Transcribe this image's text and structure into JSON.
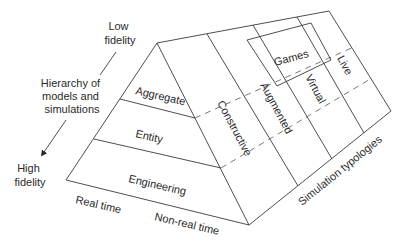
{
  "diagram": {
    "left_annotations": {
      "low_fidelity": [
        "Low",
        "fidelity"
      ],
      "hierarchy": [
        "Hierarchy of",
        "models and",
        "simulations"
      ],
      "high_fidelity": [
        "High",
        "fidelity"
      ]
    },
    "front_face_layers": [
      {
        "label": "Aggregate"
      },
      {
        "label": "Entity"
      },
      {
        "label": "Engineering"
      }
    ],
    "base_labels": {
      "real_time": "Real time",
      "non_real_time": "Non-real time"
    },
    "simulation_typologies": [
      {
        "label": "Constructive"
      },
      {
        "label": "Augmented"
      },
      {
        "label": "Virtual"
      },
      {
        "label": "Live"
      }
    ],
    "games_label": "Games",
    "right_axis_label": "Simulation typologies",
    "colors": {
      "line": "#3a3a3a",
      "dashed": "#6a6a6a",
      "text": "#2a2a2a",
      "background": "#ffffff"
    }
  }
}
